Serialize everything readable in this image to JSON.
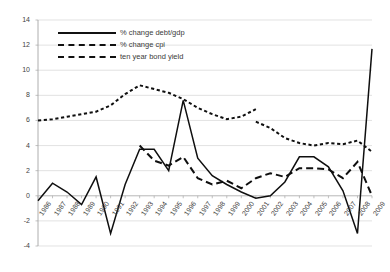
{
  "chart_data": {
    "type": "line",
    "title": "",
    "xlabel": "",
    "ylabel": "",
    "ylim": [
      -4,
      14
    ],
    "ytick_step": 2,
    "yticks": [
      -4,
      -2,
      0,
      2,
      4,
      6,
      8,
      10,
      12,
      14
    ],
    "grid": true,
    "legend_position": "upper-left-inside",
    "categories": [
      "1986",
      "1987",
      "1988",
      "1989",
      "1990",
      "1991",
      "1992",
      "1993",
      "1994",
      "1995",
      "1996",
      "1997",
      "1998",
      "1999",
      "2000",
      "2001",
      "2002",
      "2003",
      "2004",
      "2005",
      "2006",
      "2007",
      "2008",
      "2009"
    ],
    "series": [
      {
        "name": "% change debt/gdp",
        "style": "solid",
        "values": [
          -0.4,
          1.0,
          0.3,
          -0.7,
          1.5,
          -3.0,
          0.9,
          3.7,
          3.7,
          2.0,
          7.6,
          3.0,
          1.6,
          0.9,
          0.3,
          -0.2,
          0.0,
          1.1,
          3.1,
          3.1,
          2.3,
          0.4,
          -3.0,
          11.7
        ]
      },
      {
        "name": "% change cpi",
        "style": "dashed",
        "values": [
          null,
          null,
          null,
          null,
          null,
          null,
          null,
          4.0,
          2.8,
          2.4,
          3.1,
          1.4,
          0.9,
          1.2,
          0.6,
          1.4,
          1.8,
          1.5,
          2.2,
          2.2,
          2.1,
          1.4,
          2.7,
          0.0
        ]
      },
      {
        "name": "ten year bond yield",
        "style": "dotted",
        "values": [
          6.0,
          6.1,
          6.3,
          6.5,
          6.7,
          7.2,
          8.1,
          8.8,
          8.5,
          8.2,
          7.7,
          7.0,
          6.5,
          6.1,
          6.3,
          6.9,
          6.9,
          6.7,
          6.3,
          5.7,
          5.3,
          5.5,
          5.9,
          6.1
        ]
      }
    ],
    "bond_yield_tail": [
      5.9,
      5.4,
      4.6,
      4.2,
      4.0,
      4.2,
      4.1,
      4.4,
      3.5
    ]
  },
  "legend": {
    "items": [
      {
        "label": "% change debt/gdp",
        "style": "solid"
      },
      {
        "label": "% change cpi",
        "style": "dashed"
      },
      {
        "label": "ten year bond yield",
        "style": "dotted"
      }
    ]
  },
  "axes": {
    "y_tick_labels": [
      "14",
      "12",
      "10",
      "8",
      "6",
      "4",
      "2",
      "0",
      "-2",
      "-4"
    ],
    "x_tick_labels": [
      "1986",
      "1987",
      "1988",
      "1989",
      "1990",
      "1991",
      "1992",
      "1993",
      "1994",
      "1995",
      "1996",
      "1997",
      "1998",
      "1999",
      "2000",
      "2001",
      "2002",
      "2003",
      "2004",
      "2005",
      "2006",
      "2007",
      "2008",
      "2009"
    ]
  },
  "title": {
    "text": ""
  }
}
